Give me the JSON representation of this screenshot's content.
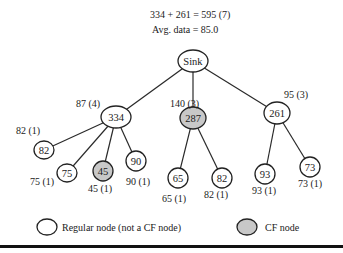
{
  "header": {
    "sum_line": "334 + 261 = 595 (7)",
    "avg_line": "Avg. data = 85.0"
  },
  "colors": {
    "regular_fill": "#ffffff",
    "cf_fill": "#c8c8c8"
  },
  "nodes": [
    {
      "id": "sink",
      "label": "Sink",
      "type": "regular",
      "annotation": ""
    },
    {
      "id": "n334",
      "label": "334",
      "type": "regular",
      "annotation": "87 (4)"
    },
    {
      "id": "n287",
      "label": "287",
      "type": "cf",
      "annotation": "140 (3)"
    },
    {
      "id": "n261",
      "label": "261",
      "type": "regular",
      "annotation": "95 (3)"
    },
    {
      "id": "n82a",
      "label": "82",
      "type": "regular",
      "annotation": "82 (1)"
    },
    {
      "id": "n75",
      "label": "75",
      "type": "regular",
      "annotation": "75 (1)"
    },
    {
      "id": "n45",
      "label": "45",
      "type": "cf",
      "annotation": "45 (1)"
    },
    {
      "id": "n90",
      "label": "90",
      "type": "regular",
      "annotation": "90 (1)"
    },
    {
      "id": "n65",
      "label": "65",
      "type": "regular",
      "annotation": "65 (1)"
    },
    {
      "id": "n82b",
      "label": "82",
      "type": "regular",
      "annotation": "82 (1)"
    },
    {
      "id": "n93",
      "label": "93",
      "type": "regular",
      "annotation": "93 (1)"
    },
    {
      "id": "n73",
      "label": "73",
      "type": "regular",
      "annotation": "73 (1)"
    }
  ],
  "edges": [
    [
      "sink",
      "n334"
    ],
    [
      "sink",
      "n287"
    ],
    [
      "sink",
      "n261"
    ],
    [
      "n334",
      "n82a"
    ],
    [
      "n334",
      "n75"
    ],
    [
      "n334",
      "n45"
    ],
    [
      "n334",
      "n90"
    ],
    [
      "n287",
      "n65"
    ],
    [
      "n287",
      "n82b"
    ],
    [
      "n261",
      "n93"
    ],
    [
      "n261",
      "n73"
    ]
  ],
  "legend": {
    "regular_label": "Regular node (not a CF node)",
    "cf_label": "CF node"
  }
}
